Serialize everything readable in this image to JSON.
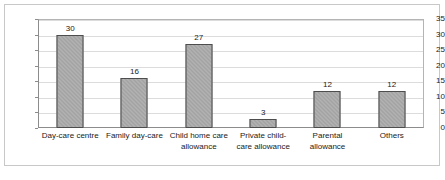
{
  "chart_data": {
    "type": "bar",
    "title": "",
    "subtitle": "",
    "xlabel": "",
    "ylabel": "",
    "ylim": [
      0,
      35
    ],
    "yticks": [
      0,
      5,
      10,
      15,
      20,
      25,
      30,
      35
    ],
    "grid": true,
    "legend": false,
    "legend_position": "none",
    "bar_color": "#a3a3a3",
    "bar_edge_color": "#4d4d4d",
    "categories": [
      "Day-care centre",
      "Family day-care",
      "Child home care allowance",
      "Private child-care allowance",
      "Parental allowance",
      "Others"
    ],
    "category_lines": [
      [
        "Day-care centre",
        ""
      ],
      [
        "Family day-care",
        ""
      ],
      [
        "Child home care",
        "allowance"
      ],
      [
        "Private child-",
        "care allowance"
      ],
      [
        "Parental",
        "allowance"
      ],
      [
        "Others",
        ""
      ]
    ],
    "values": [
      30,
      16,
      27,
      3,
      12,
      12
    ],
    "data_labels": [
      "30",
      "16",
      "27",
      "3",
      "12",
      "12"
    ],
    "ytick_labels": [
      "0",
      "5",
      "10",
      "15",
      "20",
      "25",
      "30",
      "35"
    ]
  }
}
